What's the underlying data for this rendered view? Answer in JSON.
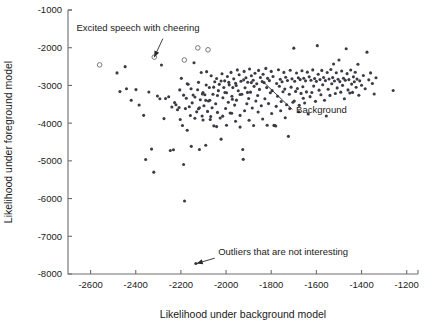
{
  "chart_data": {
    "type": "scatter",
    "title": "",
    "xlabel": "Likelihood under background model",
    "ylabel": "Likelihood under foreground model",
    "xlim": [
      -2700,
      -1150
    ],
    "ylim": [
      -8000,
      -1000
    ],
    "xticks": [
      -2600,
      -2400,
      -2200,
      -2000,
      -1800,
      -1600,
      -1400,
      -1200
    ],
    "xtick_labels": [
      "-2600",
      "-2400",
      "-2200",
      "-2000",
      "-1800",
      "-1600",
      "-1400",
      "-1200"
    ],
    "yticks": [
      -1000,
      -2000,
      -3000,
      -4000,
      -5000,
      -6000,
      -7000,
      -8000
    ],
    "ytick_labels": [
      "-1000",
      "-2000",
      "-3000",
      "-4000",
      "-5000",
      "-6000",
      "-7000",
      "-8000"
    ],
    "grid": false,
    "legend": null,
    "marker_colors": {
      "background_points": "#3b3b45",
      "excited_speech_points": "#6a6a72",
      "axis": "#6e6e6e",
      "text": "#1a1a1a"
    },
    "annotations": [
      {
        "name": "excited-speech-annotation",
        "text": "Excited speech with cheering",
        "text_x": -2390,
        "text_y": -1560,
        "arrow_from_x": -2280,
        "arrow_from_y": -1760,
        "arrow_to_x": -2318,
        "arrow_to_y": -2250
      },
      {
        "name": "background-annotation",
        "text": "Background",
        "text_x": -1690,
        "text_y": -3720,
        "arrow_from_x": -1706,
        "arrow_from_y": -3640,
        "arrow_to_x": -1832,
        "arrow_to_y": -2925
      },
      {
        "name": "outliers-annotation",
        "text": "Outliers that are not interesting",
        "text_x": -2035,
        "text_y": -7490,
        "arrow_from_x": -2050,
        "arrow_from_y": -7580,
        "arrow_to_x": -2130,
        "arrow_to_y": -7720
      }
    ],
    "series": [
      {
        "name": "Excited speech with cheering",
        "marker": "open-circle",
        "points": [
          [
            -2560,
            -2455
          ],
          [
            -2318,
            -2250
          ],
          [
            -2185,
            -2325
          ],
          [
            -2125,
            -2005
          ],
          [
            -2080,
            -2055
          ]
        ]
      },
      {
        "name": "Background",
        "marker": "filled-dot",
        "points": [
          [
            -2447,
            -2502
          ],
          [
            -2483,
            -2668
          ],
          [
            -2441,
            -3090
          ],
          [
            -2470,
            -3163
          ],
          [
            -2420,
            -3393
          ],
          [
            -2399,
            -3110
          ],
          [
            -2385,
            -3518
          ],
          [
            -2365,
            -3793
          ],
          [
            -2356,
            -4965
          ],
          [
            -2342,
            -3175
          ],
          [
            -2330,
            -4688
          ],
          [
            -2320,
            -5300
          ],
          [
            -2304,
            -3280
          ],
          [
            -2293,
            -3355
          ],
          [
            -2286,
            -2460
          ],
          [
            -2275,
            -3880
          ],
          [
            -2268,
            -3348
          ],
          [
            -2254,
            -3302
          ],
          [
            -2247,
            -4726
          ],
          [
            -2240,
            -3571
          ],
          [
            -2233,
            -4705
          ],
          [
            -2228,
            -3452
          ],
          [
            -2222,
            -3512
          ],
          [
            -2215,
            -3646
          ],
          [
            -2208,
            -3585
          ],
          [
            -2203,
            -3905
          ],
          [
            -2198,
            -2812
          ],
          [
            -2193,
            -4063
          ],
          [
            -2188,
            -5095
          ],
          [
            -2184,
            -6065
          ],
          [
            -2180,
            -3615
          ],
          [
            -2176,
            -3338
          ],
          [
            -2172,
            -4188
          ],
          [
            -2168,
            -2968
          ],
          [
            -2163,
            -3565
          ],
          [
            -2158,
            -3798
          ],
          [
            -2154,
            -4615
          ],
          [
            -2150,
            -3462
          ],
          [
            -2146,
            -3255
          ],
          [
            -2142,
            -2398
          ],
          [
            -2138,
            -3872
          ],
          [
            -2134,
            -7720
          ],
          [
            -2130,
            -3700
          ],
          [
            -2126,
            -3115
          ],
          [
            -2122,
            -3620
          ],
          [
            -2118,
            -4700
          ],
          [
            -2114,
            -3378
          ],
          [
            -2110,
            -2658
          ],
          [
            -2106,
            -3810
          ],
          [
            -2102,
            -3918
          ],
          [
            -2098,
            -3538
          ],
          [
            -2094,
            -3248
          ],
          [
            -2090,
            -4588
          ],
          [
            -2086,
            -2635
          ],
          [
            -2082,
            -3688
          ],
          [
            -2078,
            -3412
          ],
          [
            -2074,
            -3055
          ],
          [
            -2070,
            -3902
          ],
          [
            -2066,
            -2745
          ],
          [
            -2062,
            -3590
          ],
          [
            -2058,
            -3232
          ],
          [
            -2054,
            -4072
          ],
          [
            -2050,
            -2902
          ],
          [
            -2046,
            -3485
          ],
          [
            -2042,
            -2815
          ],
          [
            -2038,
            -3715
          ],
          [
            -2034,
            -3138
          ],
          [
            -2030,
            -2972
          ],
          [
            -2026,
            -3865
          ],
          [
            -2022,
            -4425
          ],
          [
            -2018,
            -2690
          ],
          [
            -2014,
            -3325
          ],
          [
            -2010,
            -3055
          ],
          [
            -2006,
            -2878
          ],
          [
            -2002,
            -3612
          ],
          [
            -1998,
            -3195
          ],
          [
            -1994,
            -2762
          ],
          [
            -1990,
            -3448
          ],
          [
            -1986,
            -2985
          ],
          [
            -1982,
            -3730
          ],
          [
            -1978,
            -2655
          ],
          [
            -1974,
            -3288
          ],
          [
            -1970,
            -3058
          ],
          [
            -1966,
            -2825
          ],
          [
            -1962,
            -3522
          ],
          [
            -1958,
            -2942
          ],
          [
            -1954,
            -3390
          ],
          [
            -1950,
            -2588
          ],
          [
            -1946,
            -3142
          ],
          [
            -1942,
            -2718
          ],
          [
            -1938,
            -3795
          ],
          [
            -1934,
            -2888
          ],
          [
            -1930,
            -3232
          ],
          [
            -1926,
            -4700
          ],
          [
            -1924,
            -4960
          ],
          [
            -1920,
            -2628
          ],
          [
            -1916,
            -3062
          ],
          [
            -1912,
            -2795
          ],
          [
            -1908,
            -3485
          ],
          [
            -1904,
            -2915
          ],
          [
            -1900,
            -3348
          ],
          [
            -1896,
            -2565
          ],
          [
            -1892,
            -3178
          ],
          [
            -1888,
            -2742
          ],
          [
            -1884,
            -3598
          ],
          [
            -1880,
            -2862
          ],
          [
            -1876,
            -3025
          ],
          [
            -1872,
            -2678
          ],
          [
            -1868,
            -3412
          ],
          [
            -1864,
            -2955
          ],
          [
            -1860,
            -3268
          ],
          [
            -1856,
            -2602
          ],
          [
            -1852,
            -3105
          ],
          [
            -1848,
            -2788
          ],
          [
            -1844,
            -3540
          ],
          [
            -1840,
            -2898
          ],
          [
            -1836,
            -2702
          ],
          [
            -1832,
            -2925
          ],
          [
            -1828,
            -3355
          ],
          [
            -1824,
            -2548
          ],
          [
            -1820,
            -3058
          ],
          [
            -1816,
            -2812
          ],
          [
            -1812,
            -3482
          ],
          [
            -1808,
            -2872
          ],
          [
            -1804,
            -3195
          ],
          [
            -1800,
            -2628
          ],
          [
            -1796,
            -3138
          ],
          [
            -1792,
            -2762
          ],
          [
            -1788,
            -4060
          ],
          [
            -1784,
            -4062
          ],
          [
            -1780,
            -4075
          ],
          [
            -1776,
            -2948
          ],
          [
            -1772,
            -3285
          ],
          [
            -1768,
            -2585
          ],
          [
            -1764,
            -3022
          ],
          [
            -1760,
            -2838
          ],
          [
            -1756,
            -3425
          ],
          [
            -1752,
            -2902
          ],
          [
            -1748,
            -3168
          ],
          [
            -1744,
            -2655
          ],
          [
            -1740,
            -3098
          ],
          [
            -1736,
            -2782
          ],
          [
            -1732,
            -3512
          ],
          [
            -1728,
            -2868
          ],
          [
            -1724,
            -4350
          ],
          [
            -1720,
            -3235
          ],
          [
            -1716,
            -2598
          ],
          [
            -1712,
            -3045
          ],
          [
            -1708,
            -2825
          ],
          [
            -1704,
            -3448
          ],
          [
            -1700,
            -2012
          ],
          [
            -1696,
            -2888
          ],
          [
            -1692,
            -3158
          ],
          [
            -1688,
            -2672
          ],
          [
            -1684,
            -3082
          ],
          [
            -1680,
            -2798
          ],
          [
            -1676,
            -3528
          ],
          [
            -1672,
            -2845
          ],
          [
            -1668,
            -3212
          ],
          [
            -1664,
            -2612
          ],
          [
            -1660,
            -3035
          ],
          [
            -1656,
            -2808
          ],
          [
            -1652,
            -3465
          ],
          [
            -1648,
            -2878
          ],
          [
            -1644,
            -3172
          ],
          [
            -1640,
            -2648
          ],
          [
            -1636,
            -3755
          ],
          [
            -1632,
            -2772
          ],
          [
            -1628,
            -3298
          ],
          [
            -1624,
            -2862
          ],
          [
            -1620,
            -3188
          ],
          [
            -1616,
            -2588
          ],
          [
            -1612,
            -3018
          ],
          [
            -1608,
            -2818
          ],
          [
            -1604,
            -3422
          ],
          [
            -1600,
            -2892
          ],
          [
            -1596,
            -1945
          ],
          [
            -1592,
            -2702
          ],
          [
            -1588,
            -3125
          ],
          [
            -1584,
            -2845
          ],
          [
            -1580,
            -3248
          ],
          [
            -1576,
            -2602
          ],
          [
            -1572,
            -2982
          ],
          [
            -1568,
            -2788
          ],
          [
            -1564,
            -3392
          ],
          [
            -1560,
            -2872
          ],
          [
            -1556,
            -3812
          ],
          [
            -1552,
            -2658
          ],
          [
            -1548,
            -3102
          ],
          [
            -1544,
            -2828
          ],
          [
            -1540,
            -3265
          ],
          [
            -1536,
            -2578
          ],
          [
            -1532,
            -2955
          ],
          [
            -1528,
            -2792
          ],
          [
            -1524,
            -2432
          ],
          [
            -1520,
            -2882
          ],
          [
            -1516,
            -3215
          ],
          [
            -1512,
            -2665
          ],
          [
            -1508,
            -3065
          ],
          [
            -1504,
            -2835
          ],
          [
            -1500,
            -2325
          ],
          [
            -1496,
            -2898
          ],
          [
            -1492,
            -3178
          ],
          [
            -1488,
            -2618
          ],
          [
            -1484,
            -2998
          ],
          [
            -1480,
            -2808
          ],
          [
            -1476,
            -3352
          ],
          [
            -1472,
            -2862
          ],
          [
            -1468,
            -2028
          ],
          [
            -1464,
            -2688
          ],
          [
            -1460,
            -3118
          ],
          [
            -1456,
            -2845
          ],
          [
            -1452,
            -3202
          ],
          [
            -1448,
            -2592
          ],
          [
            -1444,
            -2965
          ],
          [
            -1440,
            -3185
          ],
          [
            -1436,
            -2772
          ],
          [
            -1432,
            -2902
          ],
          [
            -1428,
            -2652
          ],
          [
            -1424,
            -3048
          ],
          [
            -1420,
            -2832
          ],
          [
            -1416,
            -2438
          ],
          [
            -1412,
            -3262
          ],
          [
            -1408,
            -2878
          ],
          [
            -1400,
            -2995
          ],
          [
            -1392,
            -2735
          ],
          [
            -1384,
            -3088
          ],
          [
            -1376,
            -2118
          ],
          [
            -1368,
            -2852
          ],
          [
            -1360,
            -2668
          ],
          [
            -1352,
            -2948
          ],
          [
            -1344,
            -3228
          ],
          [
            -1336,
            -2795
          ],
          [
            -1260,
            -3135
          ],
          [
            -2090,
            -3395
          ],
          [
            -2102,
            -3188
          ],
          [
            -2118,
            -3592
          ],
          [
            -2068,
            -3822
          ],
          [
            -2042,
            -4092
          ],
          [
            -2015,
            -3815
          ],
          [
            -1998,
            -4055
          ],
          [
            -1975,
            -3738
          ],
          [
            -1958,
            -3948
          ],
          [
            -1938,
            -4105
          ],
          [
            -1918,
            -3672
          ],
          [
            -1898,
            -3925
          ],
          [
            -1878,
            -4062
          ],
          [
            -1858,
            -3705
          ],
          [
            -1838,
            -3892
          ],
          [
            -1818,
            -4055
          ],
          [
            -1798,
            -3745
          ],
          [
            -1778,
            -3555
          ],
          [
            -1758,
            -3672
          ],
          [
            -1738,
            -3858
          ],
          [
            -1718,
            -3615
          ],
          [
            -1698,
            -3412
          ],
          [
            -1678,
            -3698
          ],
          [
            -1658,
            -3338
          ],
          [
            -2205,
            -3118
          ],
          [
            -2188,
            -3258
          ],
          [
            -2172,
            -2955
          ],
          [
            -2155,
            -3088
          ],
          [
            -2138,
            -3308
          ],
          [
            -2122,
            -2918
          ],
          [
            -2105,
            -3228
          ],
          [
            -2088,
            -2988
          ],
          [
            -2072,
            -3392
          ],
          [
            -2055,
            -3045
          ],
          [
            -2038,
            -3268
          ],
          [
            -2022,
            -2882
          ],
          [
            -2005,
            -3188
          ],
          [
            -1988,
            -2918
          ],
          [
            -1972,
            -3368
          ],
          [
            -1955,
            -3002
          ],
          [
            -1938,
            -3242
          ],
          [
            -1922,
            -2852
          ],
          [
            -1905,
            -3185
          ],
          [
            -1888,
            -2925
          ]
        ]
      }
    ]
  }
}
